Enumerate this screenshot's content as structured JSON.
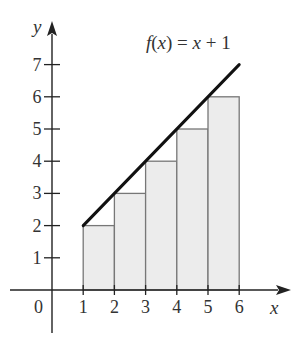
{
  "chart_data": {
    "type": "bar",
    "title": "",
    "annotation": "f(x) = x + 1",
    "xlabel": "x",
    "ylabel": "y",
    "origin_label": "0",
    "xlim": [
      0,
      6.5
    ],
    "ylim": [
      0,
      7.7
    ],
    "x_ticks": [
      "1",
      "2",
      "3",
      "4",
      "5",
      "6"
    ],
    "y_ticks": [
      "1",
      "2",
      "3",
      "4",
      "5",
      "6",
      "7"
    ],
    "grid": false,
    "legend": "none",
    "bars": {
      "description": "left-endpoint rectangles under f(x) = x + 1 on [1, 6]",
      "intervals": [
        [
          1,
          2
        ],
        [
          2,
          3
        ],
        [
          3,
          4
        ],
        [
          4,
          5
        ],
        [
          5,
          6
        ]
      ],
      "heights": [
        2,
        3,
        4,
        5,
        6
      ],
      "fill": "#ececec",
      "stroke": "#777777"
    },
    "line": {
      "name": "f(x) = x + 1",
      "x": [
        1,
        6
      ],
      "y": [
        2,
        7
      ],
      "color": "#111111"
    }
  }
}
